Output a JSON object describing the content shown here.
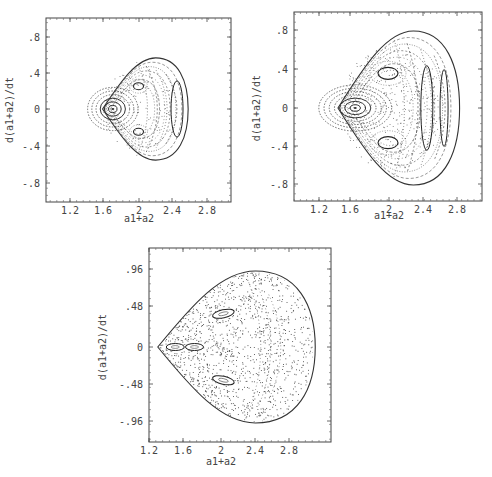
{
  "figure": {
    "panels": [
      {
        "id": "panel-a",
        "xlabel": "a1+a2",
        "ylabel": "d(a1+a2)/dt",
        "xticks": [
          "1.2",
          "1.6",
          "2",
          "2.4",
          "2.8"
        ],
        "yticks": [
          ".8",
          ".4",
          "0",
          "-.4",
          "-.8"
        ]
      },
      {
        "id": "panel-b",
        "xlabel": "a1+a2",
        "ylabel": "d(a1+a2)/dt",
        "xticks": [
          "1.2",
          "1.6",
          "2",
          "2.4",
          "2.8"
        ],
        "yticks": [
          ".8",
          ".4",
          "0",
          "-.4",
          "-.8"
        ]
      },
      {
        "id": "panel-c",
        "xlabel": "a1+a2",
        "ylabel": "d(a1+a2)/dt",
        "xticks": [
          "1.2",
          "1.6",
          "2",
          "2.4",
          "2.8"
        ],
        "yticks": [
          ".96",
          ".48",
          "0",
          "-.48",
          "-.96"
        ]
      }
    ]
  },
  "chart_data": [
    {
      "type": "scatter",
      "title": "",
      "description": "Poincare section, low energy: regular tori; central island near (1.7, 0), two islands near (2.0, ±0.25), crescent island near (2.45, 0)",
      "xlabel": "a1+a2",
      "ylabel": "d(a1+a2)/dt",
      "xlim": [
        0.95,
        3.0
      ],
      "ylim": [
        -1.0,
        1.0
      ],
      "xticks": [
        1.2,
        1.6,
        2.0,
        2.4,
        2.8
      ],
      "yticks": [
        0.8,
        0.4,
        0,
        -0.4,
        -0.8
      ],
      "boundary": {
        "xmin": 1.58,
        "xmax": 2.58,
        "ymax": 0.56,
        "ymin": -0.56
      },
      "islands": [
        {
          "center": [
            1.7,
            0.0
          ]
        },
        {
          "center": [
            2.0,
            0.25
          ]
        },
        {
          "center": [
            2.0,
            -0.25
          ]
        },
        {
          "center": [
            2.45,
            0.0
          ]
        }
      ],
      "grid": false
    },
    {
      "type": "scatter",
      "title": "",
      "description": "Poincare section, intermediate energy: mixed regular/chaotic; central island near (1.62, 0), islands near (2.0, ±0.35), crescent islands near (2.45, 0) and (2.65, 0)",
      "xlabel": "a1+a2",
      "ylabel": "d(a1+a2)/dt",
      "xlim": [
        0.95,
        3.05
      ],
      "ylim": [
        -1.0,
        1.0
      ],
      "xticks": [
        1.2,
        1.6,
        2.0,
        2.4,
        2.8
      ],
      "yticks": [
        0.8,
        0.4,
        0,
        -0.4,
        -0.8
      ],
      "boundary": {
        "xmin": 1.42,
        "xmax": 2.83,
        "ymax": 0.8,
        "ymin": -0.8
      },
      "islands": [
        {
          "center": [
            1.62,
            0.0
          ]
        },
        {
          "center": [
            2.0,
            0.36
          ]
        },
        {
          "center": [
            2.0,
            -0.36
          ]
        },
        {
          "center": [
            2.45,
            0.0
          ]
        },
        {
          "center": [
            2.65,
            0.0
          ]
        }
      ],
      "grid": false
    },
    {
      "type": "scatter",
      "title": "",
      "description": "Poincare section, high energy: widespread chaos; small islands near (1.5, 0), (1.7, 0), (2.05, ±0.4)",
      "xlabel": "a1+a2",
      "ylabel": "d(a1+a2)/dt",
      "xlim": [
        1.2,
        3.3
      ],
      "ylim": [
        -1.2,
        1.2
      ],
      "xticks": [
        1.2,
        1.6,
        2.0,
        2.4,
        2.8
      ],
      "yticks": [
        0.96,
        0.48,
        0,
        -0.48,
        -0.96
      ],
      "boundary": {
        "xmin": 1.3,
        "xmax": 3.1,
        "ymax": 0.96,
        "ymin": -0.96
      },
      "islands": [
        {
          "center": [
            1.5,
            0.0
          ]
        },
        {
          "center": [
            1.72,
            0.0
          ]
        },
        {
          "center": [
            2.05,
            0.42
          ]
        },
        {
          "center": [
            2.05,
            -0.42
          ]
        }
      ],
      "grid": false
    }
  ]
}
